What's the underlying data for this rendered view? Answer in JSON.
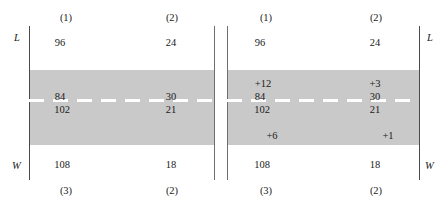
{
  "figure": {
    "colors": {
      "band": "#c9c9c9",
      "rule": "#4a4a4a",
      "dash": "#ffffff",
      "text": "#1a1a1a",
      "background": "#ffffff"
    }
  },
  "panels": [
    {
      "id": "left",
      "axis_labels": {
        "top": "L",
        "bottom": "W",
        "side": "left"
      },
      "column_headers_top": [
        "(1)",
        "(2)"
      ],
      "column_headers_bottom": [
        "(3)",
        "(2)"
      ],
      "rows": {
        "top": [
          "96",
          "24"
        ],
        "upper_adjust": [
          "",
          ""
        ],
        "mid_upper": [
          "84",
          "30"
        ],
        "mid_lower": [
          "102",
          "21"
        ],
        "lower_adjust": [
          "",
          ""
        ],
        "bottom": [
          "108",
          "18"
        ]
      }
    },
    {
      "id": "right",
      "axis_labels": {
        "top": "L",
        "bottom": "W",
        "side": "right"
      },
      "column_headers_top": [
        "(1)",
        "(2)"
      ],
      "column_headers_bottom": [
        "(3)",
        "(2)"
      ],
      "rows": {
        "top": [
          "96",
          "24"
        ],
        "upper_adjust": [
          "+12",
          "+3"
        ],
        "mid_upper": [
          "84",
          "30"
        ],
        "mid_lower": [
          "102",
          "21"
        ],
        "lower_adjust": [
          "+6",
          "+1"
        ],
        "bottom": [
          "108",
          "18"
        ]
      }
    }
  ]
}
